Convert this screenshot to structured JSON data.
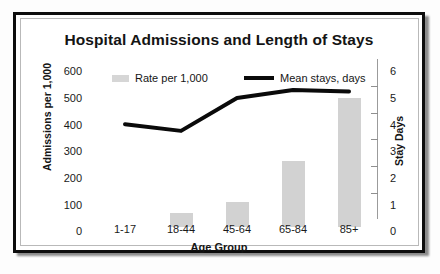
{
  "chart_data": {
    "type": "bar",
    "title": "Hospital Admissions and Length of Stays",
    "xlabel": "Age Group",
    "ylabel": "Admissions per 1,000",
    "y2label": "Stay Days",
    "categories": [
      "1-17",
      "18-44",
      "45-64",
      "65-84",
      "85+"
    ],
    "ylim": [
      0,
      600
    ],
    "y2lim": [
      0,
      6
    ],
    "yticks": [
      0,
      100,
      200,
      300,
      400,
      500,
      600
    ],
    "y2ticks": [
      0,
      1,
      2,
      3,
      4,
      5,
      6
    ],
    "grid": false,
    "legend_position": "top-inside",
    "series": [
      {
        "name": "Rate per 1,000",
        "type": "bar",
        "axis": "left",
        "color": "#d2d2d2",
        "values": [
          0,
          55,
          95,
          250,
          490
        ]
      },
      {
        "name": "Mean stays, days",
        "type": "line",
        "axis": "right",
        "color": "#0a0a0a",
        "values": [
          3.9,
          3.65,
          4.9,
          5.2,
          5.15
        ]
      }
    ]
  },
  "chart": {
    "title": "Hospital Admissions and Length of Stays",
    "y_left_title": "Admissions per 1,000",
    "y_right_title": "Stay Days",
    "x_title": "Age Group",
    "y_left_ticks": [
      "600",
      "500",
      "400",
      "300",
      "200",
      "100",
      "0"
    ],
    "y_right_ticks": [
      "6",
      "5",
      "4",
      "3",
      "2",
      "1",
      "0"
    ],
    "x_ticks": [
      "1-17",
      "18-44",
      "45-64",
      "65-84",
      "85+"
    ],
    "legend": {
      "bar_label": "Rate per 1,000",
      "line_label": "Mean stays, days"
    }
  }
}
